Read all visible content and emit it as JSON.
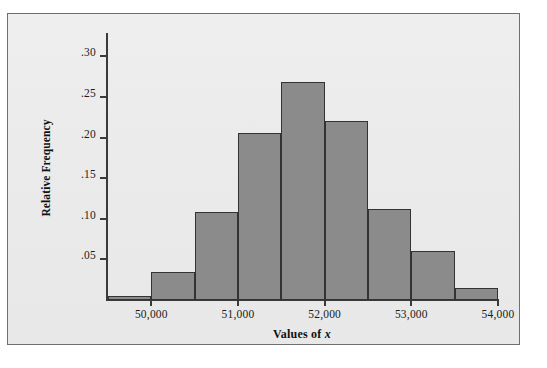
{
  "figure": {
    "background_color": "#ececec",
    "page_color": "#ffffff",
    "frame_color": "#6f6f6f"
  },
  "chart_data": {
    "type": "bar",
    "title": "",
    "subtitle": "",
    "xlabel": "Values of x",
    "xlabel_plain": "Values of",
    "xlabel_variable": "x",
    "ylabel": "Relative Frequency",
    "grid": false,
    "legend": null,
    "bar_fill_color": "#8b8b8b",
    "bar_edge_color": "#333333",
    "axis_color": "#3a3a3a",
    "xlim": [
      49500,
      54000
    ],
    "ylim": [
      0,
      0.325
    ],
    "bin_width": 500,
    "x_tick_labels": [
      "50,000",
      "51,000",
      "52,000",
      "53,000",
      "54,000"
    ],
    "x_tick_values": [
      50000,
      51000,
      52000,
      53000,
      54000
    ],
    "y_tick_labels": [
      ".05",
      ".10",
      ".15",
      ".20",
      ".25",
      ".30"
    ],
    "y_tick_values": [
      0.05,
      0.1,
      0.15,
      0.2,
      0.25,
      0.3
    ],
    "bins": [
      {
        "left": 49500,
        "right": 50000,
        "value": 0.005
      },
      {
        "left": 50000,
        "right": 50500,
        "value": 0.035
      },
      {
        "left": 50500,
        "right": 51000,
        "value": 0.108
      },
      {
        "left": 51000,
        "right": 51500,
        "value": 0.206
      },
      {
        "left": 51500,
        "right": 52000,
        "value": 0.268
      },
      {
        "left": 52000,
        "right": 52500,
        "value": 0.22
      },
      {
        "left": 52500,
        "right": 53000,
        "value": 0.112
      },
      {
        "left": 53000,
        "right": 53500,
        "value": 0.06
      },
      {
        "left": 53500,
        "right": 54000,
        "value": 0.015
      }
    ],
    "categories": [
      "49500-50000",
      "50000-50500",
      "50500-51000",
      "51000-51500",
      "51500-52000",
      "52000-52500",
      "52500-53000",
      "53000-53500",
      "53500-54000"
    ],
    "values": [
      0.005,
      0.035,
      0.108,
      0.206,
      0.268,
      0.22,
      0.112,
      0.06,
      0.015
    ]
  }
}
